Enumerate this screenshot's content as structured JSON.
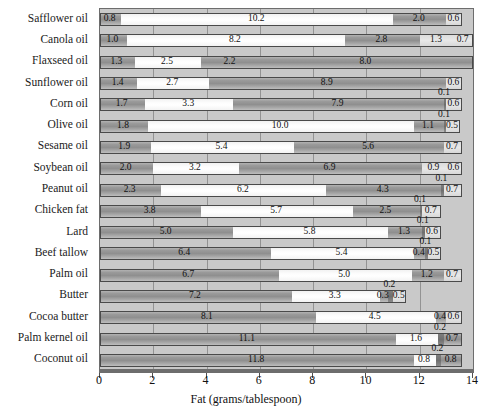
{
  "chart_data": {
    "type": "bar",
    "orientation": "horizontal",
    "stacked": true,
    "title": "",
    "xlabel": "Fat (grams/tablespoon)",
    "ylabel": "",
    "xlim": [
      0,
      14
    ],
    "xticks": [
      "0",
      "2",
      "4",
      "6",
      "8",
      "10",
      "12",
      "14"
    ],
    "grid": true,
    "legend_position": "none",
    "categories": [
      "Safflower oil",
      "Canola oil",
      "Flaxseed oil",
      "Sunflower oil",
      "Corn oil",
      "Olive oil",
      "Sesame oil",
      "Soybean oil",
      "Peanut oil",
      "Chicken fat",
      "Lard",
      "Beef tallow",
      "Palm oil",
      "Butter",
      "Cocoa butter",
      "Palm kernel oil",
      "Coconut oil"
    ],
    "series": [
      {
        "name": "saturated",
        "style": "sat",
        "values": [
          0.8,
          1.0,
          1.3,
          1.4,
          1.7,
          1.8,
          1.9,
          2.0,
          2.3,
          3.8,
          5.0,
          6.4,
          6.7,
          7.2,
          8.1,
          11.1,
          11.8
        ]
      },
      {
        "name": "monounsaturated",
        "style": "mono",
        "values": [
          10.2,
          8.2,
          2.5,
          2.7,
          3.3,
          10.0,
          5.4,
          3.2,
          6.2,
          5.7,
          5.8,
          5.4,
          5.0,
          3.3,
          4.5,
          1.6,
          0.8
        ]
      },
      {
        "name": "polyunsaturated",
        "style": "poly",
        "values": [
          2.0,
          2.8,
          2.2,
          8.9,
          7.9,
          1.1,
          5.6,
          6.9,
          4.3,
          2.5,
          1.3,
          0.4,
          1.2,
          0.3,
          0.4,
          0.7,
          0.8
        ]
      },
      {
        "name": "trans-fat",
        "style": "trans",
        "values": [
          0,
          0,
          8.0,
          0,
          0.1,
          0.1,
          0,
          0,
          0.1,
          0.1,
          0.1,
          0.1,
          0,
          0.2,
          0,
          0.2,
          0.2
        ]
      },
      {
        "name": "other",
        "style": "other",
        "values": [
          0.6,
          0.7,
          0,
          0.6,
          0.6,
          0.5,
          0.7,
          0.6,
          0.7,
          0.7,
          0.6,
          0.5,
          0.7,
          0.5,
          0.6,
          0,
          0
        ]
      }
    ],
    "rows": [
      {
        "label": "Safflower oil",
        "segments": [
          {
            "v": 0.8,
            "style": "sat",
            "label": "0.8",
            "pos": "in"
          },
          {
            "v": 10.2,
            "style": "mono",
            "label": "10.2",
            "pos": "in"
          },
          {
            "v": 2.0,
            "style": "poly",
            "label": "2.0",
            "pos": "in"
          },
          {
            "v": 0.6,
            "style": "other",
            "label": "0.6",
            "pos": "in"
          }
        ]
      },
      {
        "label": "Canola oil",
        "segments": [
          {
            "v": 1.0,
            "style": "sat",
            "label": "1.0",
            "pos": "in"
          },
          {
            "v": 8.2,
            "style": "mono",
            "label": "8.2",
            "pos": "in"
          },
          {
            "v": 2.8,
            "style": "poly",
            "label": "2.8",
            "pos": "in"
          },
          {
            "v": 1.3,
            "style": "other",
            "label": "1.3",
            "pos": "in"
          },
          {
            "v": 0.7,
            "style": "other",
            "label": "0.7",
            "pos": "in"
          }
        ]
      },
      {
        "label": "Flaxseed oil",
        "segments": [
          {
            "v": 1.3,
            "style": "sat",
            "label": "1.3",
            "pos": "in"
          },
          {
            "v": 2.5,
            "style": "mono",
            "label": "2.5",
            "pos": "in"
          },
          {
            "v": 2.2,
            "style": "poly",
            "label": "2.2",
            "pos": "in"
          },
          {
            "v": 8.0,
            "style": "poly",
            "label": "8.0",
            "pos": "in"
          }
        ]
      },
      {
        "label": "Sunflower oil",
        "segments": [
          {
            "v": 1.4,
            "style": "sat",
            "label": "1.4",
            "pos": "in"
          },
          {
            "v": 2.7,
            "style": "mono",
            "label": "2.7",
            "pos": "in"
          },
          {
            "v": 8.9,
            "style": "poly",
            "label": "8.9",
            "pos": "in"
          },
          {
            "v": 0.6,
            "style": "other",
            "label": "0.6",
            "pos": "in"
          }
        ]
      },
      {
        "label": "Corn oil",
        "segments": [
          {
            "v": 1.7,
            "style": "sat",
            "label": "1.7",
            "pos": "in"
          },
          {
            "v": 3.3,
            "style": "mono",
            "label": "3.3",
            "pos": "in"
          },
          {
            "v": 7.9,
            "style": "poly",
            "label": "7.9",
            "pos": "in"
          },
          {
            "v": 0.1,
            "style": "trans",
            "label": "0.1",
            "pos": "above"
          },
          {
            "v": 0.6,
            "style": "other",
            "label": "0.6",
            "pos": "in"
          }
        ]
      },
      {
        "label": "Olive oil",
        "segments": [
          {
            "v": 1.8,
            "style": "sat",
            "label": "1.8",
            "pos": "in"
          },
          {
            "v": 10.0,
            "style": "mono",
            "label": "10.0",
            "pos": "in"
          },
          {
            "v": 1.1,
            "style": "poly",
            "label": "1.1",
            "pos": "in"
          },
          {
            "v": 0.1,
            "style": "trans",
            "label": "0.1",
            "pos": "above"
          },
          {
            "v": 0.5,
            "style": "other",
            "label": "0.5",
            "pos": "in"
          }
        ]
      },
      {
        "label": "Sesame oil",
        "segments": [
          {
            "v": 1.9,
            "style": "sat",
            "label": "1.9",
            "pos": "in"
          },
          {
            "v": 5.4,
            "style": "mono",
            "label": "5.4",
            "pos": "in"
          },
          {
            "v": 5.6,
            "style": "poly",
            "label": "5.6",
            "pos": "in"
          },
          {
            "v": 0.7,
            "style": "other",
            "label": "0.7",
            "pos": "in"
          }
        ]
      },
      {
        "label": "Soybean oil",
        "segments": [
          {
            "v": 2.0,
            "style": "sat",
            "label": "2.0",
            "pos": "in"
          },
          {
            "v": 3.2,
            "style": "mono",
            "label": "3.2",
            "pos": "in"
          },
          {
            "v": 6.9,
            "style": "poly",
            "label": "6.9",
            "pos": "in"
          },
          {
            "v": 0.9,
            "style": "other",
            "label": "0.9",
            "pos": "in"
          },
          {
            "v": 0.6,
            "style": "other",
            "label": "0.6",
            "pos": "in"
          }
        ]
      },
      {
        "label": "Peanut oil",
        "segments": [
          {
            "v": 2.3,
            "style": "sat",
            "label": "2.3",
            "pos": "in"
          },
          {
            "v": 6.2,
            "style": "mono",
            "label": "6.2",
            "pos": "in"
          },
          {
            "v": 4.3,
            "style": "poly",
            "label": "4.3",
            "pos": "in"
          },
          {
            "v": 0.1,
            "style": "trans",
            "label": "0.1",
            "pos": "above"
          },
          {
            "v": 0.7,
            "style": "other",
            "label": "0.7",
            "pos": "in"
          }
        ]
      },
      {
        "label": "Chicken fat",
        "segments": [
          {
            "v": 3.8,
            "style": "sat",
            "label": "3.8",
            "pos": "in"
          },
          {
            "v": 5.7,
            "style": "mono",
            "label": "5.7",
            "pos": "in"
          },
          {
            "v": 2.5,
            "style": "poly",
            "label": "2.5",
            "pos": "in"
          },
          {
            "v": 0.1,
            "style": "trans",
            "label": "0.1",
            "pos": "above"
          },
          {
            "v": 0.7,
            "style": "other",
            "label": "0.7",
            "pos": "in"
          }
        ]
      },
      {
        "label": "Lard",
        "segments": [
          {
            "v": 5.0,
            "style": "sat",
            "label": "5.0",
            "pos": "in"
          },
          {
            "v": 5.8,
            "style": "mono",
            "label": "5.8",
            "pos": "in"
          },
          {
            "v": 1.3,
            "style": "poly",
            "label": "1.3",
            "pos": "in"
          },
          {
            "v": 0.1,
            "style": "trans",
            "label": "0.1",
            "pos": "above"
          },
          {
            "v": 0.6,
            "style": "other",
            "label": "0.6",
            "pos": "in"
          }
        ]
      },
      {
        "label": "Beef tallow",
        "segments": [
          {
            "v": 6.4,
            "style": "sat",
            "label": "6.4",
            "pos": "in"
          },
          {
            "v": 5.4,
            "style": "mono",
            "label": "5.4",
            "pos": "in"
          },
          {
            "v": 0.4,
            "style": "poly",
            "label": "0.4",
            "pos": "in"
          },
          {
            "v": 0.1,
            "style": "trans",
            "label": "0.1",
            "pos": "above"
          },
          {
            "v": 0.5,
            "style": "other",
            "label": "0.5",
            "pos": "in"
          }
        ]
      },
      {
        "label": "Palm oil",
        "segments": [
          {
            "v": 6.7,
            "style": "sat",
            "label": "6.7",
            "pos": "in"
          },
          {
            "v": 5.0,
            "style": "mono",
            "label": "5.0",
            "pos": "in"
          },
          {
            "v": 1.2,
            "style": "poly",
            "label": "1.2",
            "pos": "in"
          },
          {
            "v": 0.7,
            "style": "other",
            "label": "0.7",
            "pos": "in"
          }
        ]
      },
      {
        "label": "Butter",
        "segments": [
          {
            "v": 7.2,
            "style": "sat",
            "label": "7.2",
            "pos": "in"
          },
          {
            "v": 3.3,
            "style": "mono",
            "label": "3.3",
            "pos": "in"
          },
          {
            "v": 0.3,
            "style": "poly",
            "label": "0.3",
            "pos": "in"
          },
          {
            "v": 0.2,
            "style": "trans",
            "label": "0.2",
            "pos": "above"
          },
          {
            "v": 0.5,
            "style": "other",
            "label": "0.5",
            "pos": "in"
          }
        ]
      },
      {
        "label": "Cocoa butter",
        "segments": [
          {
            "v": 8.1,
            "style": "sat",
            "label": "8.1",
            "pos": "in"
          },
          {
            "v": 4.5,
            "style": "mono",
            "label": "4.5",
            "pos": "in"
          },
          {
            "v": 0.4,
            "style": "poly",
            "label": "0.4",
            "pos": "in"
          },
          {
            "v": 0.6,
            "style": "other",
            "label": "0.6",
            "pos": "in"
          }
        ]
      },
      {
        "label": "Palm kernel oil",
        "segments": [
          {
            "v": 11.1,
            "style": "sat",
            "label": "11.1",
            "pos": "in"
          },
          {
            "v": 1.6,
            "style": "mono",
            "label": "1.6",
            "pos": "in"
          },
          {
            "v": 0.2,
            "style": "trans",
            "label": "0.2",
            "pos": "above"
          },
          {
            "v": 0.7,
            "style": "poly",
            "label": "0.7",
            "pos": "in"
          }
        ]
      },
      {
        "label": "Coconut oil",
        "segments": [
          {
            "v": 11.8,
            "style": "sat",
            "label": "11.8",
            "pos": "in"
          },
          {
            "v": 0.8,
            "style": "mono",
            "label": "0.8",
            "pos": "in"
          },
          {
            "v": 0.2,
            "style": "trans",
            "label": "0.2",
            "pos": "above"
          },
          {
            "v": 0.8,
            "style": "poly",
            "label": "0.8",
            "pos": "in"
          }
        ]
      }
    ],
    "colors": {
      "saturated": "#9a9a9a",
      "monounsaturated": "#fdfdfd",
      "polyunsaturated": "#9a9a9a",
      "trans": "#6e6e6e",
      "other": "#e0e0e0",
      "plot_background": "#c9c9c9",
      "axis": "#6d6d6d",
      "text": "#111111"
    }
  }
}
